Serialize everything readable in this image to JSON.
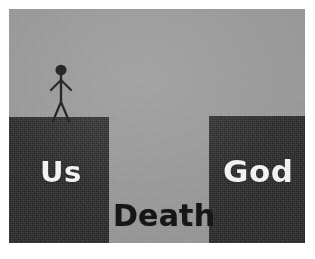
{
  "image": {
    "title": "Us - Death - God chasm illustration",
    "background_color": "#ffffff",
    "canvas_color": "#9a9a9a",
    "block_color": "#2e2e2e",
    "label_light_color": "#f3f3f3",
    "label_dark_color": "#161616"
  },
  "labels": {
    "left_block": "Us",
    "right_block": "God",
    "chasm": "Death"
  },
  "figure": {
    "name": "stick-figure"
  }
}
